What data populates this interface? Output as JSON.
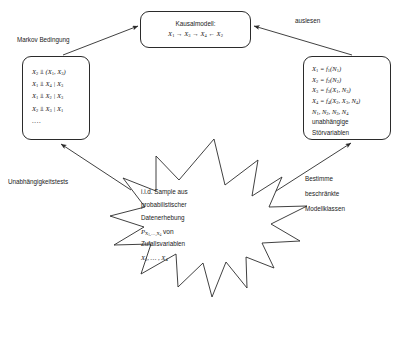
{
  "diagram": {
    "background_color": "#ffffff",
    "stroke_color": "#2b2b2b"
  },
  "causal_model_box": {
    "name": "Kausalmodell",
    "heading": "Kausalmodell:",
    "formula_html": "X<sub>1</sub> <span class=\"op\">→</span> X<sub>3</sub> <span class=\"op\">→</span> X<sub>4</sub> <span class=\"op\">←</span> X<sub>2</sub>"
  },
  "independence_box": {
    "name": "Unabhängigkeitsaussagen",
    "lines_html": [
      "X<sub>2</sub> <span class=\"op\">⫫</span> (X<sub>1</sub>, X<sub>3</sub>)",
      "X<sub>1</sub> <span class=\"op\">⫫</span> X<sub>4</sub> | X<sub>3</sub>",
      "X<sub>1</sub> <span class=\"op\">⫫</span> X<sub>2</sub> | X<sub>3</sub>",
      "X<sub>2</sub> <span class=\"op\">⫫</span> X<sub>3</sub> | X<sub>1</sub>"
    ],
    "ellipsis": "...."
  },
  "scm_box": {
    "name": "Strukturgleichungen",
    "equations_html": [
      "X<sub>1</sub> = f<sub>1</sub>(N<sub>1</sub>)",
      "X<sub>2</sub> = f<sub>2</sub>(N<sub>2</sub>)",
      "X<sub>3</sub> = f<sub>3</sub>(X<sub>1</sub>, N<sub>3</sub>)",
      "X<sub>4</sub> = f<sub>4</sub>(X<sub>2</sub>, X<sub>3</sub>, N<sub>4</sub>)"
    ],
    "noise_html": "N<sub>1</sub>, N<sub>2</sub>, N<sub>3</sub>, N<sub>4</sub>",
    "noise_desc_line1": "unabhängige",
    "noise_desc_line2": "Störvariablen"
  },
  "star": {
    "name": "Datenstern",
    "lines": [
      {
        "type": "plain",
        "text": "i.i.d. Sample aus"
      },
      {
        "type": "plain",
        "text": "probabilistischer"
      },
      {
        "type": "plain",
        "text": "Datenerhebung"
      },
      {
        "type": "math",
        "html": "P<sub>X<sub>1</sub>,…,X<sub>4</sub></sub> <span class=\"op\" style=\"font-style:normal\">von</span>"
      },
      {
        "type": "plain",
        "text": "Zufallsvariablen"
      },
      {
        "type": "math",
        "html": "X<sub>1</sub>, … , X<sub>4</sub>"
      }
    ]
  },
  "edge_labels": {
    "markov": "Markov Bedingung",
    "auslesen": "auslesen",
    "independence_tests": "Unabhängigkeitstests",
    "bestimme_line1": "Bestimme",
    "bestimme_line2": "beschränkte",
    "bestimme_line3": "Modellklassen"
  }
}
